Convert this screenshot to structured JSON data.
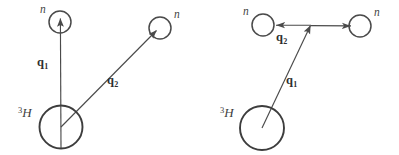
{
  "figure": {
    "kind": "physics-vector-diagram",
    "stroke_color": "#4a4a4a",
    "nucleus_stroke_color": "#3d3d3d",
    "background": "#ffffff",
    "width": 399,
    "height": 155
  },
  "panels": [
    {
      "id": "left",
      "name": "sequential-two-step-knockout",
      "nucleus": {
        "label_sup": "3",
        "label_element": "H",
        "cx": 61,
        "cy": 127,
        "r": 21.5,
        "label_x": 18,
        "label_y": 107
      },
      "particles": [
        {
          "id": "neutron-up",
          "label": "n",
          "cx": 60,
          "cy": 22,
          "r": 11,
          "label_x": 40,
          "label_y": 5
        },
        {
          "id": "neutron-right",
          "label": "n",
          "cx": 160,
          "cy": 28,
          "r": 11,
          "label_x": 174,
          "label_y": 10
        }
      ],
      "vectors": [
        {
          "id": "q1",
          "label": "q",
          "sub": "1",
          "from": [
            61,
            127
          ],
          "to": [
            60,
            22
          ],
          "label_x": 37,
          "label_y": 57
        },
        {
          "id": "q2",
          "label": "q",
          "sub": "2",
          "from": [
            61,
            127
          ],
          "to": [
            158,
            29
          ],
          "label_x": 107,
          "label_y": 75
        }
      ]
    },
    {
      "id": "right",
      "name": "single-step-two-neutron-knockout",
      "nucleus": {
        "label_sup": "3",
        "label_element": "H",
        "cx": 262,
        "cy": 128,
        "r": 22,
        "label_x": 220,
        "label_y": 107
      },
      "particles": [
        {
          "id": "neutron-left",
          "label": "n",
          "cx": 263,
          "cy": 25,
          "r": 11,
          "label_x": 243,
          "label_y": 7
        },
        {
          "id": "neutron-right",
          "label": "n",
          "cx": 360,
          "cy": 26,
          "r": 11,
          "label_x": 374,
          "label_y": 8
        }
      ],
      "vectors": [
        {
          "id": "q1",
          "label": "q",
          "sub": "1",
          "from": [
            262,
            128
          ],
          "to": [
            310,
            27
          ],
          "label_x": 286,
          "label_y": 75
        },
        {
          "id": "q2",
          "label": "q",
          "sub": "2",
          "from": [
            310,
            27
          ],
          "to": [
            274,
            26
          ],
          "to_secondary": [
            349,
            26
          ],
          "label_x": 276,
          "label_y": 32
        }
      ]
    }
  ]
}
